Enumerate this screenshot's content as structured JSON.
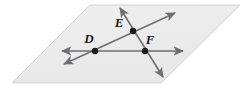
{
  "figure": {
    "type": "geometry-diagram",
    "canvas": {
      "width": 249,
      "height": 89,
      "background": "#ffffff"
    },
    "plane": {
      "name": "plane",
      "shape": "parallelogram",
      "fill": "#ededed",
      "stroke": "#d3d3d3",
      "stroke_width": 1,
      "vertices": [
        {
          "x": 90,
          "y": 5
        },
        {
          "x": 240,
          "y": 5
        },
        {
          "x": 161,
          "y": 83
        },
        {
          "x": 12,
          "y": 83
        }
      ]
    },
    "line_style": {
      "stroke": "#6e6e73",
      "stroke_width": 1.6,
      "arrow_fill": "#6e6e73"
    },
    "lines": [
      {
        "name": "horizontal-line-DF",
        "through": [
          "D",
          "F"
        ],
        "x1": 62,
        "y1": 51,
        "x2": 183,
        "y2": 51,
        "arrow_start": true,
        "arrow_end": true
      },
      {
        "name": "diagonal-line-DE",
        "through": [
          "D",
          "E"
        ],
        "x1": 64,
        "y1": 64,
        "x2": 175,
        "y2": 13,
        "arrow_start": true,
        "arrow_end": true
      },
      {
        "name": "steep-line-EF",
        "through": [
          "E",
          "F"
        ],
        "x1": 120,
        "y1": 8,
        "x2": 163,
        "y2": 77,
        "arrow_start": true,
        "arrow_end": true
      }
    ],
    "points": [
      {
        "id": "D",
        "label": "D",
        "x": 95,
        "y": 51,
        "radius": 3.2,
        "fill": "#1b1b1b",
        "label_x": 89,
        "label_y": 43
      },
      {
        "id": "E",
        "label": "E",
        "x": 133,
        "y": 31,
        "radius": 3.2,
        "fill": "#1b1b1b",
        "label_x": 119,
        "label_y": 27
      },
      {
        "id": "F",
        "label": "F",
        "x": 145,
        "y": 51,
        "radius": 3.2,
        "fill": "#1b1b1b",
        "label_x": 150,
        "label_y": 44
      }
    ]
  }
}
